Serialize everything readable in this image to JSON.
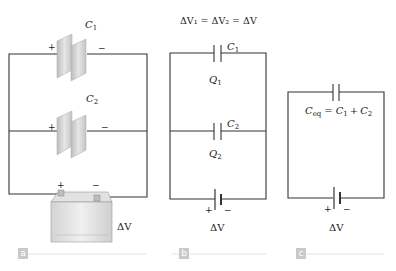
{
  "figure": {
    "panels": [
      {
        "id": "a",
        "label": "a",
        "capacitors": [
          {
            "name": "C",
            "sub": "1",
            "plus": "+",
            "minus": "−"
          },
          {
            "name": "C",
            "sub": "2",
            "plus": "+",
            "minus": "−"
          }
        ],
        "battery": {
          "plus": "+",
          "minus": "−",
          "voltage_label": "ΔV"
        }
      },
      {
        "id": "b",
        "label": "b",
        "equation": "ΔV₁ = ΔV₂ = ΔV",
        "capacitors": [
          {
            "name": "C",
            "sub": "1",
            "charge": "Q",
            "charge_sub": "1"
          },
          {
            "name": "C",
            "sub": "2",
            "charge": "Q",
            "charge_sub": "2"
          }
        ],
        "battery": {
          "plus": "+",
          "minus": "−",
          "voltage_label": "ΔV"
        }
      },
      {
        "id": "c",
        "label": "c",
        "equivalent": {
          "lhs": "C",
          "lhs_sub": "eq",
          "eq": "=",
          "rhs1": "C",
          "rhs1_sub": "1",
          "plus": "+",
          "rhs2": "C",
          "rhs2_sub": "2"
        },
        "battery": {
          "plus": "+",
          "minus": "−",
          "voltage_label": "ΔV"
        }
      }
    ],
    "colors": {
      "wire": "#333333",
      "plate": "#c8c8c8",
      "label_bg": "#c9c9c9",
      "rule": "#e3e3e3"
    }
  }
}
